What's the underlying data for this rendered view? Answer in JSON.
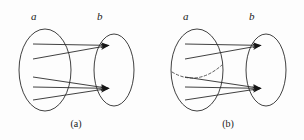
{
  "figure": {
    "background_color": "#fdfdfd",
    "stroke_color": "#2b2b2b",
    "dashed_color": "#4a4a4a",
    "width": 304,
    "height": 140
  },
  "panels": [
    {
      "id": "a",
      "caption": "(a)",
      "source_set_label": "a",
      "target_set_label": "b",
      "has_dashed_curve": false,
      "arrow_count": 2,
      "line_count": 5,
      "description": "Five lines leave the left ellipse a and converge into two arrowheads inside the right ellipse b"
    },
    {
      "id": "b",
      "caption": "(b)",
      "source_set_label": "a",
      "target_set_label": "b",
      "has_dashed_curve": true,
      "arrow_count": 2,
      "line_count": 5,
      "description": "Same as panel a but with a dashed curve drawn across the left ellipse a"
    }
  ],
  "diagram_data": {
    "type": "set-mapping-diagram",
    "panel_a": {
      "left_ellipse": {
        "cx": 45,
        "cy": 70,
        "rx": 26,
        "ry": 41
      },
      "right_ellipse": {
        "cx": 114,
        "cy": 70,
        "rx": 20,
        "ry": 36
      },
      "targets": [
        {
          "x": 111,
          "y": 45
        },
        {
          "x": 111,
          "y": 88
        }
      ],
      "sources": [
        {
          "x": 33,
          "y": 44,
          "target": 0
        },
        {
          "x": 33,
          "y": 59,
          "target": 0
        },
        {
          "x": 33,
          "y": 77,
          "target": 1
        },
        {
          "x": 33,
          "y": 87,
          "target": 1
        },
        {
          "x": 33,
          "y": 100,
          "target": 1
        }
      ]
    },
    "panel_b": {
      "left_ellipse": {
        "cx": 45,
        "cy": 70,
        "rx": 26,
        "ry": 41
      },
      "right_ellipse": {
        "cx": 114,
        "cy": 70,
        "rx": 20,
        "ry": 36
      },
      "targets": [
        {
          "x": 111,
          "y": 45
        },
        {
          "x": 111,
          "y": 88
        }
      ],
      "sources": [
        {
          "x": 33,
          "y": 44,
          "target": 0
        },
        {
          "x": 33,
          "y": 59,
          "target": 0
        },
        {
          "x": 33,
          "y": 77,
          "target": 1
        },
        {
          "x": 33,
          "y": 87,
          "target": 1
        },
        {
          "x": 33,
          "y": 100,
          "target": 1
        }
      ],
      "dashed_curve": {
        "x1": 20,
        "y1": 72,
        "cx": 45,
        "cy": 86,
        "x2": 70,
        "y2": 66
      }
    }
  }
}
